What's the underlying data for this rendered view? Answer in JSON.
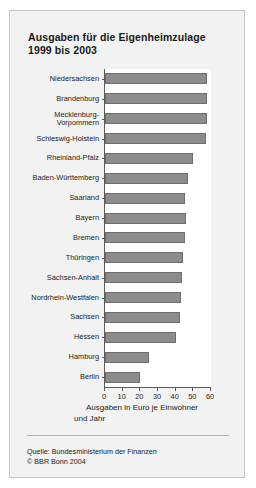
{
  "chart_data": {
    "type": "bar",
    "orientation": "horizontal",
    "title": "Ausgaben für die Eigenheimzulage 1999 bis 2003",
    "title_line1": "Ausgaben für die Eigenheimzulage",
    "title_line2": "1999 bis 2003",
    "xlabel": "Ausgaben in Euro je Einwohner und Jahr",
    "xlabel_line1": "Ausgaben in Euro je Einwohner",
    "xlabel_line2": "und Jahr",
    "ylabel": "",
    "xlim": [
      0,
      60
    ],
    "xticks": [
      0,
      10,
      20,
      30,
      40,
      50,
      60
    ],
    "xticklabels": [
      "0",
      "10",
      "20",
      "30",
      "40",
      "50",
      "60"
    ],
    "grid": false,
    "legend": false,
    "bar_color": "#8c8c8c",
    "bar_edge_color": "#6e6e6e",
    "categories": [
      "Niedersachsen",
      "Brandenburg",
      "Mecklenburg-\nVorpommern",
      "Schleswig-Holstein",
      "Rheinland-Pfalz",
      "Baden-Württemberg",
      "Saarland",
      "Bayern",
      "Bremen",
      "Thüringen",
      "Sachsen-Anhalt",
      "Nordrhein-Westfalen",
      "Sachsen",
      "Hessen",
      "Hamburg",
      "Berlin"
    ],
    "values": [
      58,
      58,
      57.5,
      57,
      50,
      47,
      45,
      46,
      45,
      44,
      43.5,
      43,
      42.5,
      40,
      25,
      20
    ]
  },
  "source": {
    "line1": "Quelle: Bundesministerium der Finanzen",
    "line2": "© BBR Bonn 2004"
  }
}
